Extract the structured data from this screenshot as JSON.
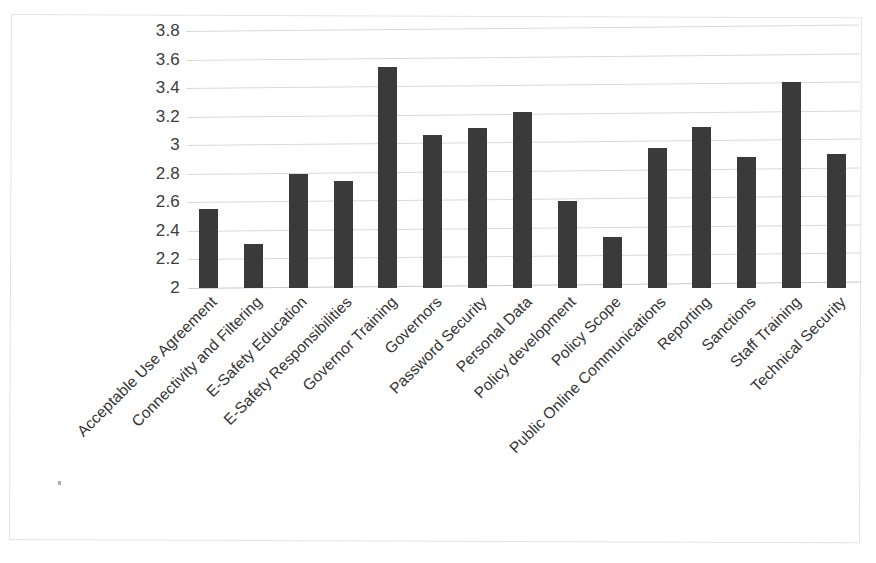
{
  "chart_data": {
    "type": "bar",
    "title": "",
    "subtitle": "",
    "xlabel": "",
    "ylabel": "",
    "ylim": [
      2,
      3.8
    ],
    "y_ticks": [
      "2",
      "2.2",
      "2.4",
      "2.6",
      "2.8",
      "3",
      "3.2",
      "3.4",
      "3.6",
      "3.8"
    ],
    "y_tick_values": [
      2,
      2.2,
      2.4,
      2.6,
      2.8,
      3,
      3.2,
      3.4,
      3.6,
      3.8
    ],
    "grid": true,
    "grid_axis": "y",
    "legend": false,
    "legend_position": "none",
    "bar_color": "#3a3a3a",
    "gridline_color": "#d9d9d9",
    "background_color": "#ffffff",
    "categories": [
      "Acceptable Use Agreement",
      "Connectivity and Filtering",
      "E-Safety Education",
      "E-Safety Responsibilities",
      "Governor Training",
      "Governors",
      "Password Security",
      "Personal Data",
      "Policy development",
      "Policy Scope",
      "Public Online Communications",
      "Reporting",
      "Sanctions",
      "Staff Training",
      "Technical Security"
    ],
    "values": [
      2.55,
      2.31,
      2.8,
      2.75,
      3.55,
      3.07,
      3.12,
      3.23,
      2.61,
      2.36,
      2.98,
      3.13,
      2.92,
      3.44,
      2.94
    ]
  }
}
